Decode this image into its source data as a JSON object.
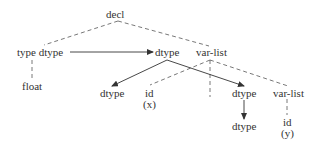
{
  "diagram": {
    "type": "annotated-parse-tree-dependency-graph",
    "colors": {
      "line": "#444444",
      "text": "#333333",
      "background": "#ffffff"
    },
    "nodes": [
      {
        "id": "decl",
        "label": "decl",
        "x": 106,
        "y": 9
      },
      {
        "id": "type_dtype",
        "label": "type dtype",
        "x": 17,
        "y": 47
      },
      {
        "id": "dtype_mid",
        "label": "dtype",
        "x": 155,
        "y": 47
      },
      {
        "id": "varlist_top",
        "label": "var-list",
        "x": 196,
        "y": 47
      },
      {
        "id": "float",
        "label": "float",
        "x": 22,
        "y": 81
      },
      {
        "id": "dtype_left",
        "label": "dtype",
        "x": 100,
        "y": 88
      },
      {
        "id": "id_x",
        "label": "id",
        "x": 145,
        "y": 88
      },
      {
        "id": "id_x_val",
        "label": "(x)",
        "x": 143,
        "y": 99
      },
      {
        "id": "dtype_right",
        "label": "dtype",
        "x": 232,
        "y": 88
      },
      {
        "id": "varlist_right",
        "label": "var-list",
        "x": 273,
        "y": 88
      },
      {
        "id": "dtype_bottom",
        "label": "dtype",
        "x": 232,
        "y": 121
      },
      {
        "id": "id_y",
        "label": "id",
        "x": 283,
        "y": 117
      },
      {
        "id": "id_y_val",
        "label": "(y)",
        "x": 281,
        "y": 128
      }
    ],
    "tree_edges_dashed": [
      {
        "from": "decl",
        "to": "type_dtype"
      },
      {
        "from": "decl",
        "to": "varlist_top"
      },
      {
        "from": "type_dtype",
        "to": "float"
      },
      {
        "from": "varlist_top",
        "to": "id_x"
      },
      {
        "from": "varlist_top",
        "to": "comma_gap"
      },
      {
        "from": "varlist_top",
        "to": "varlist_right"
      },
      {
        "from": "varlist_right",
        "to": "id_y"
      }
    ],
    "dependency_edges_solid": [
      {
        "from": "type_dtype",
        "to": "dtype_mid"
      },
      {
        "from": "dtype_mid",
        "to": "dtype_left"
      },
      {
        "from": "dtype_mid",
        "to": "dtype_right"
      },
      {
        "from": "dtype_right",
        "to": "dtype_bottom"
      }
    ]
  }
}
